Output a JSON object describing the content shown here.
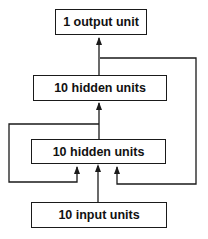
{
  "diagram": {
    "type": "network-architecture",
    "nodes": [
      {
        "id": "output",
        "label": "1 output unit"
      },
      {
        "id": "hidden2",
        "label": "10 hidden units"
      },
      {
        "id": "hidden1",
        "label": "10 hidden units"
      },
      {
        "id": "input",
        "label": "10 input units"
      }
    ],
    "edges": [
      {
        "from": "input",
        "to": "hidden1"
      },
      {
        "from": "hidden1",
        "to": "hidden2"
      },
      {
        "from": "hidden2",
        "to": "output"
      },
      {
        "from": "hidden1",
        "to": "hidden1",
        "kind": "recurrent-left"
      },
      {
        "from": "hidden2",
        "to": "hidden1",
        "kind": "recurrent-right"
      }
    ],
    "colors": {
      "line": "#1a1a1a",
      "background": "#ffffff"
    }
  }
}
